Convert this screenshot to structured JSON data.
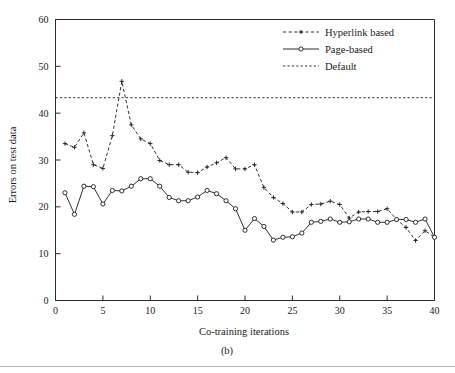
{
  "chart_data": {
    "type": "line",
    "title": "",
    "xlabel": "Co-training iterations",
    "ylabel": "Errors on test data",
    "xlim": [
      0,
      40
    ],
    "ylim": [
      0,
      60
    ],
    "xticks": [
      0,
      5,
      10,
      15,
      20,
      25,
      30,
      35,
      40
    ],
    "yticks": [
      0,
      10,
      20,
      30,
      40,
      50,
      60
    ],
    "grid": false,
    "legend_position": "top-right",
    "x": [
      1,
      2,
      3,
      4,
      5,
      6,
      7,
      8,
      9,
      10,
      11,
      12,
      13,
      14,
      15,
      16,
      17,
      18,
      19,
      20,
      21,
      22,
      23,
      24,
      25,
      26,
      27,
      28,
      29,
      30,
      31,
      32,
      33,
      34,
      35,
      36,
      37,
      38,
      39,
      40
    ],
    "series": [
      {
        "name": "Hyperlink based",
        "style": "dashed",
        "marker": "plus",
        "values": [
          33.5,
          32.7,
          35.8,
          29.0,
          28.2,
          35.2,
          46.8,
          37.5,
          34.5,
          33.5,
          29.9,
          29.0,
          29.0,
          27.4,
          27.3,
          28.5,
          29.4,
          30.5,
          28.1,
          28.1,
          29.0,
          24.1,
          22.0,
          20.7,
          18.9,
          18.9,
          20.5,
          20.6,
          21.2,
          20.5,
          17.6,
          18.9,
          19.0,
          19.0,
          19.6,
          17.3,
          15.6,
          12.8,
          14.9,
          13.5
        ]
      },
      {
        "name": "Page-based",
        "style": "solid",
        "marker": "circle",
        "values": [
          23.0,
          18.4,
          24.4,
          24.3,
          20.6,
          23.5,
          23.4,
          24.4,
          26.0,
          26.0,
          24.4,
          22.0,
          21.3,
          21.3,
          22.1,
          23.5,
          22.8,
          21.3,
          19.6,
          15.0,
          17.5,
          15.8,
          12.9,
          13.5,
          13.6,
          14.4,
          16.7,
          16.9,
          17.4,
          16.7,
          16.8,
          17.4,
          17.4,
          16.7,
          16.7,
          17.3,
          17.3,
          16.7,
          17.4,
          13.5
        ]
      },
      {
        "name": "Default",
        "style": "dotted",
        "marker": "none",
        "constant_value": 43.3
      }
    ],
    "legend": [
      {
        "label": "Hyperlink based",
        "style": "dashed",
        "marker": "plus"
      },
      {
        "label": "Page-based",
        "style": "solid",
        "marker": "circle"
      },
      {
        "label": "Default",
        "style": "dotted",
        "marker": "none"
      }
    ],
    "caption": "(b)",
    "colors": {
      "line": "#1a1a1a",
      "axis": "#2b2b2b",
      "background": "#ffffff",
      "rule": "#b4b4b4"
    }
  }
}
